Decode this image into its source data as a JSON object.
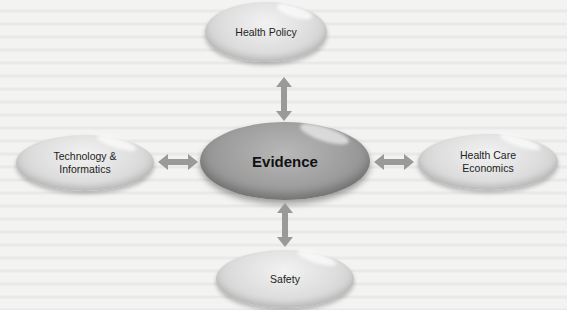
{
  "diagram": {
    "center": {
      "label": "Evidence"
    },
    "nodes": {
      "top": {
        "label": "Health Policy"
      },
      "left": {
        "label": "Technology &\nInformatics"
      },
      "right": {
        "label": "Health Care\nEconomics"
      },
      "bottom": {
        "label": "Safety"
      }
    },
    "arrow_color": "#9a9a9a",
    "connections": [
      {
        "from": "Evidence",
        "to": "Health Policy",
        "type": "bidirectional"
      },
      {
        "from": "Evidence",
        "to": "Technology & Informatics",
        "type": "bidirectional"
      },
      {
        "from": "Evidence",
        "to": "Health Care Economics",
        "type": "bidirectional"
      },
      {
        "from": "Evidence",
        "to": "Safety",
        "type": "bidirectional"
      }
    ]
  }
}
